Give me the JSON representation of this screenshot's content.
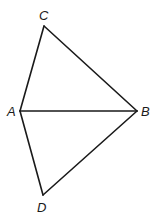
{
  "diagram": {
    "type": "geometry",
    "points": {
      "A": {
        "label": "A",
        "x": 20,
        "y": 111,
        "label_x": 7,
        "label_y": 116
      },
      "B": {
        "label": "B",
        "x": 137,
        "y": 111,
        "label_x": 141,
        "label_y": 116
      },
      "C": {
        "label": "C",
        "x": 44,
        "y": 26,
        "label_x": 39,
        "label_y": 20
      },
      "D": {
        "label": "D",
        "x": 43,
        "y": 195,
        "label_x": 37,
        "label_y": 212
      }
    },
    "segments": [
      {
        "from": "A",
        "to": "C"
      },
      {
        "from": "C",
        "to": "B"
      },
      {
        "from": "A",
        "to": "B"
      },
      {
        "from": "A",
        "to": "D"
      },
      {
        "from": "D",
        "to": "B"
      }
    ]
  }
}
